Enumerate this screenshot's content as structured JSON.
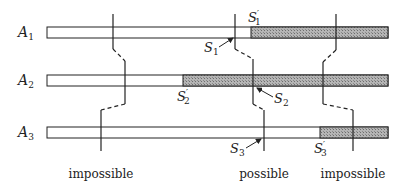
{
  "diagram": {
    "rows": [
      {
        "label": "A",
        "sub": "1",
        "y": 27,
        "shade_start": 251
      },
      {
        "label": "A",
        "sub": "2",
        "y": 75,
        "shade_start": 183
      },
      {
        "label": "A",
        "sub": "3",
        "y": 127,
        "shade_start": 320
      }
    ],
    "bar": {
      "x_start": 47,
      "x_end": 388,
      "height": 11
    },
    "colors": {
      "line": "#222222",
      "shade": "#9a9a9a",
      "bar_fill": "#ffffff"
    },
    "annotations": {
      "s1": {
        "label": "S",
        "sub": "1"
      },
      "s1p": {
        "label": "S",
        "sub": "1",
        "prime": "′"
      },
      "s2": {
        "label": "S",
        "sub": "2"
      },
      "s2p": {
        "label": "S",
        "sub": "2",
        "prime": "′"
      },
      "s3": {
        "label": "S",
        "sub": "3"
      },
      "s3p": {
        "label": "S",
        "sub": "3",
        "prime": "′"
      }
    },
    "outcomes": {
      "left": "impossible",
      "middle": "possible",
      "right": "impossible"
    }
  }
}
